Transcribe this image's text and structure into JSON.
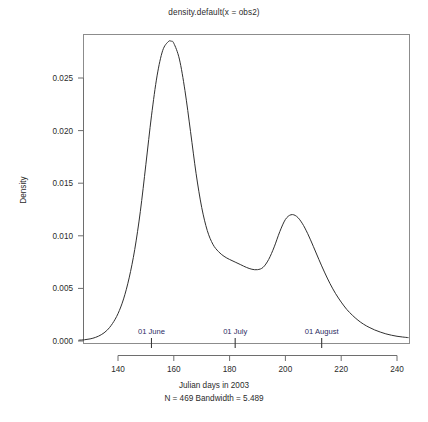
{
  "chart_data": {
    "type": "line",
    "title": "density.default(x = obs2)",
    "xlabel": "Julian days in 2003",
    "xlabel_sub": "N = 469   Bandwidth = 5.489",
    "ylabel": "Density",
    "n": 469,
    "bandwidth": 5.489,
    "xlim": [
      126,
      244
    ],
    "ylim": [
      0.0,
      0.0295
    ],
    "xticks": [
      140,
      160,
      180,
      200,
      220,
      240
    ],
    "yticks": [
      0.0,
      0.005,
      0.01,
      0.015,
      0.02,
      0.025
    ],
    "ytick_labels": [
      "0.000",
      "0.005",
      "0.010",
      "0.015",
      "0.020",
      "0.025"
    ],
    "xtick_labels": [
      "140",
      "160",
      "180",
      "200",
      "220",
      "240"
    ],
    "grid": false,
    "legend": "none",
    "line_color": "#303030",
    "annotation_color": "#2c2c63",
    "series": [
      {
        "name": "density",
        "x": [
          126,
          128,
          130,
          132,
          134,
          136,
          138,
          140,
          142,
          144,
          146,
          148,
          150,
          152,
          154,
          156,
          158,
          159,
          160,
          162,
          164,
          166,
          168,
          170,
          172,
          174,
          176,
          178,
          180,
          182,
          184,
          186,
          188,
          190,
          192,
          194,
          196,
          198,
          200,
          202,
          204,
          206,
          208,
          210,
          212,
          214,
          216,
          218,
          220,
          222,
          224,
          226,
          228,
          230,
          232,
          234,
          236,
          238,
          240,
          242,
          244
        ],
        "y": [
          8e-05,
          0.00012,
          0.0002,
          0.00035,
          0.0006,
          0.001,
          0.00165,
          0.0026,
          0.004,
          0.006,
          0.0087,
          0.0123,
          0.0168,
          0.0214,
          0.0252,
          0.0276,
          0.02845,
          0.0285,
          0.0283,
          0.0268,
          0.0238,
          0.0199,
          0.0159,
          0.0127,
          0.0105,
          0.0092,
          0.0085,
          0.00805,
          0.00775,
          0.0075,
          0.00725,
          0.007,
          0.00682,
          0.00678,
          0.007,
          0.00775,
          0.00895,
          0.0104,
          0.01155,
          0.012,
          0.01185,
          0.0112,
          0.0102,
          0.009,
          0.00775,
          0.00655,
          0.00545,
          0.0045,
          0.0037,
          0.003,
          0.00245,
          0.00198,
          0.0016,
          0.0013,
          0.00105,
          0.00085,
          0.00068,
          0.00055,
          0.00045,
          0.00038,
          0.00032
        ]
      }
    ],
    "annotations": [
      {
        "label": "01 June",
        "x": 152,
        "day": 152
      },
      {
        "label": "01 July",
        "x": 182,
        "day": 182
      },
      {
        "label": "01 August",
        "x": 213,
        "day": 213
      }
    ]
  }
}
